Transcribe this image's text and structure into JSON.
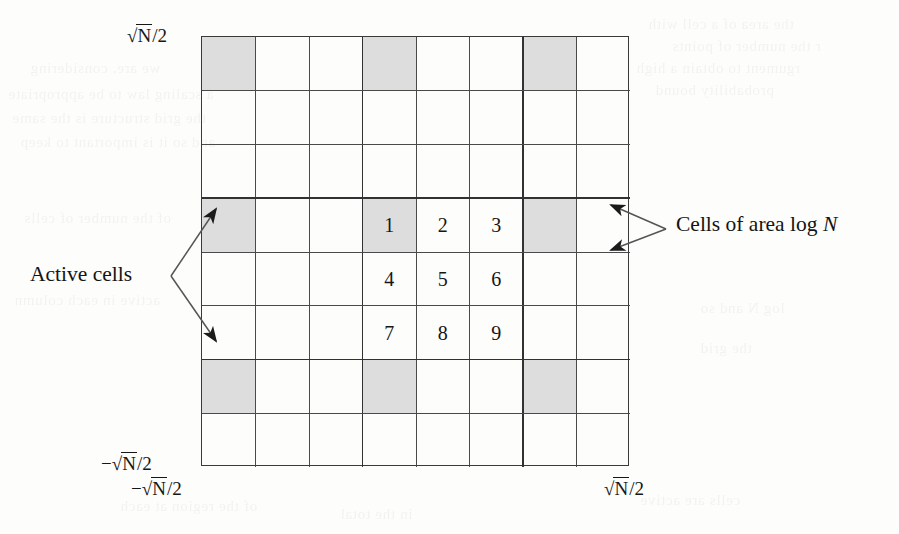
{
  "figure": {
    "background_color": "#fdfdfc",
    "line_color": "#4a4a4a",
    "shade_color": "#dddddd",
    "text_color": "#161616"
  },
  "grid": {
    "columns": 8,
    "rows": 8,
    "thick_divider_columns": [
      3,
      6
    ],
    "thick_divider_rows": [
      3,
      6
    ],
    "shaded_cells": [
      {
        "row": 1,
        "col": 1
      },
      {
        "row": 1,
        "col": 4
      },
      {
        "row": 1,
        "col": 7
      },
      {
        "row": 4,
        "col": 1
      },
      {
        "row": 4,
        "col": 4
      },
      {
        "row": 4,
        "col": 7
      },
      {
        "row": 7,
        "col": 1
      },
      {
        "row": 7,
        "col": 4
      },
      {
        "row": 7,
        "col": 7
      }
    ],
    "numbered_cells": [
      {
        "row": 4,
        "col": 4,
        "label": "1"
      },
      {
        "row": 4,
        "col": 5,
        "label": "2"
      },
      {
        "row": 4,
        "col": 6,
        "label": "3"
      },
      {
        "row": 5,
        "col": 4,
        "label": "4"
      },
      {
        "row": 5,
        "col": 5,
        "label": "5"
      },
      {
        "row": 5,
        "col": 6,
        "label": "6"
      },
      {
        "row": 6,
        "col": 4,
        "label": "7"
      },
      {
        "row": 6,
        "col": 5,
        "label": "8"
      },
      {
        "row": 6,
        "col": 6,
        "label": "9"
      }
    ]
  },
  "axis_labels": {
    "top_left": {
      "sign": "",
      "radicand": "N",
      "divisor": "/2"
    },
    "bottom_left_y": {
      "sign": "−",
      "radicand": "N",
      "divisor": "/2"
    },
    "bottom_left_x": {
      "sign": "−",
      "radicand": "N",
      "divisor": "/2"
    },
    "bottom_right_x": {
      "sign": "",
      "radicand": "N",
      "divisor": "/2"
    }
  },
  "callouts": {
    "left": {
      "text": "Active cells",
      "targets": [
        "shaded-cell-r4c1",
        "shaded-cell-r7c1"
      ]
    },
    "right": {
      "text_before": "Cells of area log ",
      "text_italic": "N",
      "targets": [
        "cell-r4c8",
        "cell-r5c8"
      ]
    }
  },
  "ghost_text": [
    {
      "x": 648,
      "y": 16,
      "size": 15,
      "text": "the area of a cell with"
    },
    {
      "x": 672,
      "y": 38,
      "size": 15,
      "text": "r the number of points"
    },
    {
      "x": 636,
      "y": 60,
      "size": 15,
      "text": "rgument to obtain a high"
    },
    {
      "x": 655,
      "y": 82,
      "size": 15,
      "text": "probability bound"
    },
    {
      "x": 30,
      "y": 60,
      "size": 15,
      "text": "we are, considering"
    },
    {
      "x": 8,
      "y": 86,
      "size": 15,
      "text": "a scaling law to be appropriate"
    },
    {
      "x": 12,
      "y": 110,
      "size": 15,
      "text": "the grid structure is the same"
    },
    {
      "x": 20,
      "y": 134,
      "size": 15,
      "text": "and so it is important to keep"
    },
    {
      "x": 24,
      "y": 210,
      "size": 15,
      "text": "of the number of cells"
    },
    {
      "x": 14,
      "y": 292,
      "size": 15,
      "text": "active in each column"
    },
    {
      "x": 700,
      "y": 300,
      "size": 15,
      "text": "log N and so"
    },
    {
      "x": 700,
      "y": 340,
      "size": 15,
      "text": "the grid"
    },
    {
      "x": 120,
      "y": 498,
      "size": 15,
      "text": "of the region at each"
    },
    {
      "x": 640,
      "y": 492,
      "size": 15,
      "text": "cells are active"
    },
    {
      "x": 340,
      "y": 506,
      "size": 15,
      "text": "in the total"
    }
  ]
}
